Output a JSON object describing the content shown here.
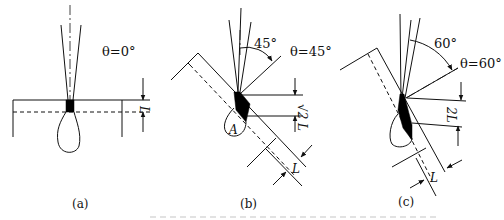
{
  "figure": {
    "panels": [
      {
        "id": "a",
        "caption": "(a)",
        "angle_label": "θ=0°",
        "dimension_label": "L"
      },
      {
        "id": "b",
        "caption": "(b)",
        "angle_label": "θ=45°",
        "arc_label": "45°",
        "dimension_label_vertical": "√2 L",
        "dimension_label_thickness": "L",
        "point_label": "A"
      },
      {
        "id": "c",
        "caption": "(c)",
        "angle_label": "θ=60°",
        "arc_label": "60°",
        "dimension_label_vertical": "2L",
        "dimension_label_thickness": "L"
      }
    ]
  },
  "colors": {
    "line": "#111111",
    "background": "#ffffff"
  }
}
